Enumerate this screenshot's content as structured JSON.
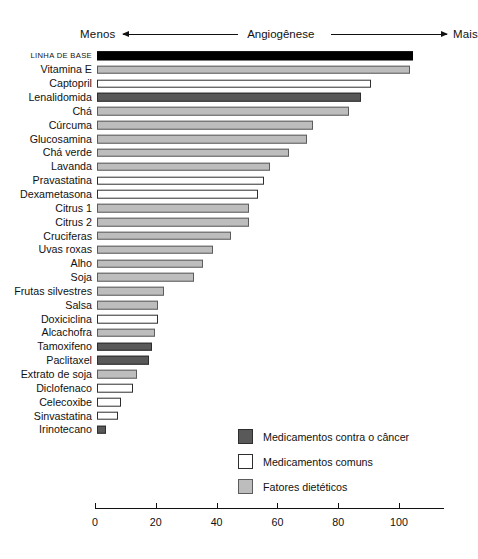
{
  "header": {
    "left_label": "Menos",
    "title": "Angiogênese",
    "right_label": "Mais"
  },
  "legend": {
    "position": "inside-bottom-right",
    "items": [
      {
        "label": "Medicamentos contra o câncer",
        "key": "cancer",
        "color": "#595959"
      },
      {
        "label": "Medicamentos comuns",
        "key": "common",
        "color": "#ffffff"
      },
      {
        "label": "Fatores dietéticos",
        "key": "diet",
        "color": "#bdbdbd"
      }
    ]
  },
  "axis": {
    "ticks": [
      "0",
      "20",
      "40",
      "60",
      "80",
      "100"
    ],
    "tick_values": [
      0,
      20,
      40,
      60,
      80,
      100
    ],
    "min": 0,
    "max": 115
  },
  "chart_data": {
    "type": "bar",
    "orientation": "horizontal",
    "title": "Angiogênese",
    "subtitle": "",
    "xlabel": "",
    "ylabel": "",
    "xlim": [
      0,
      115
    ],
    "grid": false,
    "legend_position": "inside-bottom-right",
    "annotations": [
      "Menos",
      "Angiogênese",
      "Mais"
    ],
    "series_keys": {
      "cancer": "Medicamentos contra o câncer",
      "common": "Medicamentos comuns",
      "diet": "Fatores dietéticos",
      "baseline": "Linha de base"
    },
    "categories": [
      "LINHA DE BASE",
      "Vitamina E",
      "Captopril",
      "Lenalidomida",
      "Chá",
      "Cúrcuma",
      "Glucosamina",
      "Chá verde",
      "Lavanda",
      "Pravastatina",
      "Dexametasona",
      "Citrus 1",
      "Citrus 2",
      "Cruciferas",
      "Uvas roxas",
      "Alho",
      "Soja",
      "Frutas silvestres",
      "Salsa",
      "Doxiciclina",
      "Alcachofra",
      "Tamoxifeno",
      "Paclitaxel",
      "Extrato de soja",
      "Diclofenaco",
      "Celecoxibe",
      "Sinvastatina",
      "Irinotecano"
    ],
    "values": [
      104,
      103,
      90,
      87,
      83,
      71,
      69,
      63,
      57,
      55,
      53,
      50,
      50,
      44,
      38,
      35,
      32,
      22,
      20,
      20,
      19,
      18,
      17,
      13,
      12,
      8,
      7,
      3
    ],
    "categories_group": [
      "baseline",
      "diet",
      "common",
      "cancer",
      "diet",
      "diet",
      "diet",
      "diet",
      "diet",
      "common",
      "common",
      "diet",
      "diet",
      "diet",
      "diet",
      "diet",
      "diet",
      "diet",
      "diet",
      "common",
      "diet",
      "cancer",
      "cancer",
      "diet",
      "common",
      "common",
      "common",
      "cancer"
    ],
    "bars": [
      {
        "label": "LINHA DE BASE",
        "value": 104,
        "group": "baseline"
      },
      {
        "label": "Vitamina E",
        "value": 103,
        "group": "diet"
      },
      {
        "label": "Captopril",
        "value": 90,
        "group": "common"
      },
      {
        "label": "Lenalidomida",
        "value": 87,
        "group": "cancer"
      },
      {
        "label": "Chá",
        "value": 83,
        "group": "diet"
      },
      {
        "label": "Cúrcuma",
        "value": 71,
        "group": "diet"
      },
      {
        "label": "Glucosamina",
        "value": 69,
        "group": "diet"
      },
      {
        "label": "Chá verde",
        "value": 63,
        "group": "diet"
      },
      {
        "label": "Lavanda",
        "value": 57,
        "group": "diet"
      },
      {
        "label": "Pravastatina",
        "value": 55,
        "group": "common"
      },
      {
        "label": "Dexametasona",
        "value": 53,
        "group": "common"
      },
      {
        "label": "Citrus 1",
        "value": 50,
        "group": "diet"
      },
      {
        "label": "Citrus 2",
        "value": 50,
        "group": "diet"
      },
      {
        "label": "Cruciferas",
        "value": 44,
        "group": "diet"
      },
      {
        "label": "Uvas roxas",
        "value": 38,
        "group": "diet"
      },
      {
        "label": "Alho",
        "value": 35,
        "group": "diet"
      },
      {
        "label": "Soja",
        "value": 32,
        "group": "diet"
      },
      {
        "label": "Frutas silvestres",
        "value": 22,
        "group": "diet"
      },
      {
        "label": "Salsa",
        "value": 20,
        "group": "diet"
      },
      {
        "label": "Doxiciclina",
        "value": 20,
        "group": "common"
      },
      {
        "label": "Alcachofra",
        "value": 19,
        "group": "diet"
      },
      {
        "label": "Tamoxifeno",
        "value": 18,
        "group": "cancer"
      },
      {
        "label": "Paclitaxel",
        "value": 17,
        "group": "cancer"
      },
      {
        "label": "Extrato de soja",
        "value": 13,
        "group": "diet"
      },
      {
        "label": "Diclofenaco",
        "value": 12,
        "group": "common"
      },
      {
        "label": "Celecoxibe",
        "value": 8,
        "group": "common"
      },
      {
        "label": "Sinvastatina",
        "value": 7,
        "group": "common"
      },
      {
        "label": "Irinotecano",
        "value": 3,
        "group": "cancer"
      }
    ]
  }
}
